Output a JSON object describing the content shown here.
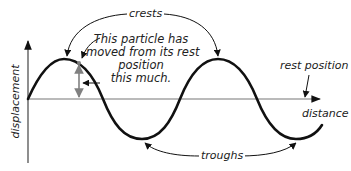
{
  "diagram": {
    "labels": {
      "crests": "crests",
      "troughs": "troughs",
      "rest_position": "rest position",
      "x_axis": "distance",
      "y_axis": "displacement",
      "particle_note": {
        "line1": "This particle has",
        "line2": "moved from its rest",
        "line3": "position",
        "line4": "this much."
      }
    },
    "colors": {
      "wave": "#111111",
      "axes": "#444444",
      "baseline": "#777777",
      "displacement_marker": "#808080",
      "text": "#222222"
    },
    "geometry": {
      "y_axis": {
        "x": 28,
        "top": 39,
        "bottom": 163
      },
      "x_axis": {
        "y": 99,
        "left": 28,
        "right": 322
      },
      "crest_points": [
        [
          64,
          59
        ],
        [
          218,
          59
        ]
      ],
      "trough_points": [
        [
          142,
          139
        ],
        [
          296,
          139
        ]
      ],
      "displacement_marker_x": 79
    }
  }
}
